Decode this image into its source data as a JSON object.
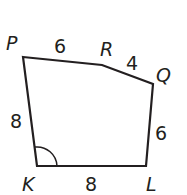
{
  "diagram": {
    "type": "polygon",
    "shape": "pentagon",
    "stroke_color": "#231f20",
    "background": "#ffffff",
    "vertices": [
      {
        "name": "P",
        "x": 23,
        "y": 57
      },
      {
        "name": "R",
        "x": 102,
        "y": 65
      },
      {
        "name": "Q",
        "x": 153,
        "y": 84
      },
      {
        "name": "L",
        "x": 146,
        "y": 166
      },
      {
        "name": "K",
        "x": 37,
        "y": 166
      }
    ],
    "vertex_labels": {
      "P": "P",
      "R": "R",
      "Q": "Q",
      "K": "K",
      "L": "L"
    },
    "side_lengths": {
      "PR": "6",
      "RQ": "4",
      "QL": "6",
      "KL": "8",
      "PK": "8"
    },
    "angle_marks": [
      {
        "vertex": "K",
        "type": "arc"
      }
    ]
  }
}
